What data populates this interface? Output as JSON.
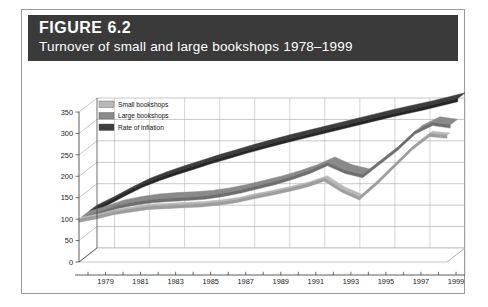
{
  "figure": {
    "number_label": "FIGURE 6.2",
    "title": "Turnover of small and large bookshops 1978–1999"
  },
  "colors": {
    "title_band": "#3a3a3a",
    "small_bookshops": "#b9b9b9",
    "small_bookshops_side": "#9d9d9d",
    "large_bookshops": "#8a8a8a",
    "large_bookshops_side": "#6e6e6e",
    "rate_of_inflation": "#3d3d3d",
    "rate_of_inflation_side": "#262626",
    "gridline": "#b0b0b0",
    "axis": "#4a4a4a",
    "card_border": "#9a9a9a"
  },
  "legend": {
    "position": "top-left-inside-plot",
    "items": [
      {
        "label": "Small bookshops",
        "swatch": "#b9b9b9"
      },
      {
        "label": "Large bookshops",
        "swatch": "#8a8a8a"
      },
      {
        "label": "Rate of inflation",
        "swatch": "#3d3d3d"
      }
    ]
  },
  "chart_data": {
    "type": "area",
    "title": "Turnover of small and large bookshops 1978–1999",
    "xlabel": "",
    "ylabel": "",
    "ylim": [
      0,
      350
    ],
    "yticks": [
      0,
      50,
      100,
      150,
      200,
      250,
      300,
      350
    ],
    "ytick_labels": [
      "0",
      "50",
      "100",
      "150",
      "200",
      "250",
      "300",
      "350"
    ],
    "grid": true,
    "three_d": true,
    "x": [
      1978,
      1979,
      1980,
      1981,
      1982,
      1983,
      1984,
      1985,
      1986,
      1987,
      1988,
      1989,
      1990,
      1991,
      1992,
      1993,
      1994,
      1995,
      1996,
      1997,
      1998,
      1999
    ],
    "xtick_labels": [
      "1979",
      "1981",
      "1983",
      "1985",
      "1987",
      "1989",
      "1991",
      "1993",
      "1995",
      "1997",
      "1999"
    ],
    "xtick_years": [
      1979,
      1981,
      1983,
      1985,
      1987,
      1989,
      1991,
      1993,
      1995,
      1997,
      1999
    ],
    "legend_position": "upper left",
    "series": [
      {
        "name": "Small bookshops",
        "color": "#b9b9b9",
        "values": [
          100,
          108,
          118,
          124,
          130,
          132,
          134,
          136,
          140,
          146,
          155,
          163,
          172,
          182,
          196,
          170,
          152,
          188,
          228,
          268,
          300,
          296
        ]
      },
      {
        "name": "Large bookshops",
        "color": "#8a8a8a",
        "values": [
          100,
          112,
          126,
          134,
          140,
          143,
          145,
          148,
          154,
          162,
          172,
          182,
          194,
          208,
          226,
          208,
          198,
          230,
          262,
          300,
          320,
          314
        ]
      },
      {
        "name": "Rate of inflation",
        "color": "#3d3d3d",
        "values": [
          100,
          120,
          142,
          162,
          178,
          192,
          205,
          218,
          230,
          242,
          253,
          264,
          274,
          284,
          294,
          304,
          314,
          324,
          333,
          342,
          352,
          362
        ]
      }
    ]
  }
}
